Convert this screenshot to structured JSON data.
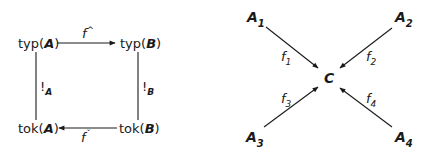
{
  "left_diagram": {
    "nodes": {
      "top_left": {
        "prefix": "typ(",
        "var": "A",
        "suffix": ")"
      },
      "top_right": {
        "prefix": "typ(",
        "var": "B",
        "suffix": ")"
      },
      "bottom_left": {
        "prefix": "tok(",
        "var": "A",
        "suffix": ")"
      },
      "bottom_right": {
        "prefix": "tok(",
        "var": "B",
        "suffix": ")"
      }
    },
    "edges": {
      "top": {
        "label": "f",
        "mark": "^",
        "direction": "typ(A) → typ(B)"
      },
      "bottom": {
        "label": "f",
        "mark": "ˇ",
        "direction": "tok(B) → tok(A)"
      },
      "left": {
        "label": "!",
        "sub": "A",
        "connects": "typ(A) — tok(A)"
      },
      "right": {
        "label": "!",
        "sub": "B",
        "connects": "typ(B) — tok(B)"
      }
    }
  },
  "right_diagram": {
    "center": "C",
    "sources": [
      {
        "label": "A",
        "sub": "1",
        "edge": "f",
        "edge_sub": "1"
      },
      {
        "label": "A",
        "sub": "2",
        "edge": "f",
        "edge_sub": "2"
      },
      {
        "label": "A",
        "sub": "3",
        "edge": "f",
        "edge_sub": "3"
      },
      {
        "label": "A",
        "sub": "4",
        "edge": "f",
        "edge_sub": "4"
      }
    ]
  },
  "colors": {
    "ink": "#1a1a1a",
    "background": "#ffffff"
  }
}
